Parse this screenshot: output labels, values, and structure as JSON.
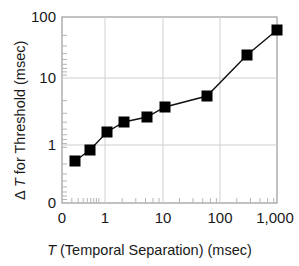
{
  "chart_data": {
    "type": "line",
    "title": "",
    "xlabel": "T (Temporal Separation) (msec)",
    "xlabel_parts": {
      "symbol": "T",
      "rest": " (Temporal Separation) (msec)"
    },
    "ylabel": "Δ T for Threshold (msec)",
    "ylabel_parts": {
      "prefix": "Δ ",
      "symbol": "T",
      "rest": " for Threshold (msec)"
    },
    "xscale": "log",
    "yscale": "log",
    "xlim": [
      0.2,
      1000
    ],
    "ylim": [
      0.35,
      100
    ],
    "grid": true,
    "legend": null,
    "marker": "filled-square",
    "marker_color": "#000000",
    "line_color": "#000000",
    "xticks": [
      {
        "value": 0,
        "label": "0"
      },
      {
        "value": 1,
        "label": "1"
      },
      {
        "value": 10,
        "label": "10"
      },
      {
        "value": 100,
        "label": "100"
      },
      {
        "value": 1000,
        "label": "1,000"
      }
    ],
    "yticks": [
      {
        "value": 0,
        "label": "0"
      },
      {
        "value": 1,
        "label": "1"
      },
      {
        "value": 10,
        "label": "10"
      },
      {
        "value": 100,
        "label": "100"
      }
    ],
    "series": [
      {
        "name": "Delta T threshold",
        "x": [
          0.3,
          0.55,
          1.1,
          2.2,
          5.5,
          11,
          60,
          300,
          1000
        ],
        "y": [
          0.52,
          0.85,
          1.6,
          2.3,
          2.8,
          3.9,
          5.7,
          25,
          62
        ]
      }
    ],
    "points": [
      {
        "x": 0.3,
        "y": 0.52,
        "px": 75,
        "py": 161
      },
      {
        "x": 0.55,
        "y": 0.85,
        "px": 90,
        "py": 150
      },
      {
        "x": 1.1,
        "y": 1.6,
        "px": 107,
        "py": 132
      },
      {
        "x": 2.2,
        "y": 2.3,
        "px": 124,
        "py": 122
      },
      {
        "x": 5.5,
        "y": 2.8,
        "px": 147,
        "py": 117
      },
      {
        "x": 11,
        "y": 3.9,
        "px": 165,
        "py": 107
      },
      {
        "x": 60,
        "y": 5.7,
        "px": 207,
        "py": 96
      },
      {
        "x": 300,
        "y": 25,
        "px": 247,
        "py": 55
      },
      {
        "x": 1000,
        "y": 62,
        "px": 277,
        "py": 30
      }
    ],
    "axes_pixels": {
      "left": 62,
      "right": 277,
      "top": 17,
      "bottom": 203,
      "x_gridlines_px": [
        105,
        163,
        220
      ],
      "y_gridlines_px": [
        78,
        145
      ]
    }
  }
}
